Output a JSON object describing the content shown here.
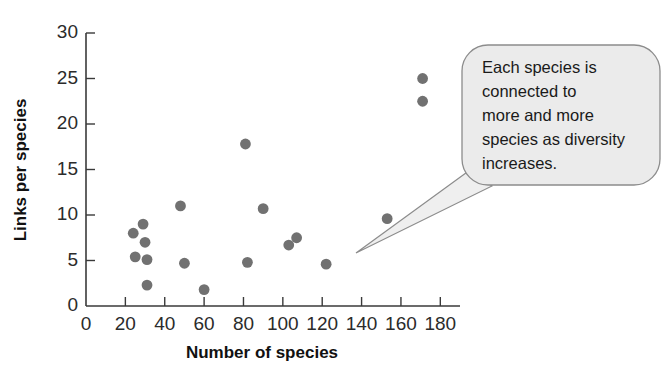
{
  "chart_data": {
    "type": "scatter",
    "title": "",
    "xlabel": "Number of species",
    "ylabel": "Links per species",
    "xlim": [
      0,
      190
    ],
    "ylim": [
      0,
      30
    ],
    "grid": false,
    "legend": null,
    "xticks": [
      0,
      20,
      40,
      60,
      80,
      100,
      120,
      140,
      160,
      180
    ],
    "xtick_labels": [
      "0",
      "20",
      "40",
      "60",
      "80",
      "100",
      "120",
      "140",
      "160",
      "180"
    ],
    "yticks": [
      0,
      5,
      10,
      15,
      20,
      25,
      30
    ],
    "ytick_labels": [
      "0",
      "5",
      "10",
      "15",
      "20",
      "25",
      "30"
    ],
    "point_color": "#717171",
    "points": [
      {
        "x": 24,
        "y": 8.0
      },
      {
        "x": 25,
        "y": 5.4
      },
      {
        "x": 29,
        "y": 9.0
      },
      {
        "x": 30,
        "y": 7.0
      },
      {
        "x": 31,
        "y": 5.1
      },
      {
        "x": 31,
        "y": 2.3
      },
      {
        "x": 48,
        "y": 11.0
      },
      {
        "x": 50,
        "y": 4.7
      },
      {
        "x": 60,
        "y": 1.8
      },
      {
        "x": 81,
        "y": 17.8
      },
      {
        "x": 82,
        "y": 4.8
      },
      {
        "x": 90,
        "y": 10.7
      },
      {
        "x": 103,
        "y": 6.7
      },
      {
        "x": 107,
        "y": 7.5
      },
      {
        "x": 122,
        "y": 4.6
      },
      {
        "x": 153,
        "y": 9.6
      },
      {
        "x": 171,
        "y": 25.0
      },
      {
        "x": 171,
        "y": 22.5
      }
    ],
    "annotations": [
      {
        "id": "diversity-callout",
        "shape": "speech-bubble",
        "lines": [
          "Each species is",
          "connected to",
          "more and more",
          "species as diversity",
          "increases."
        ],
        "fill": "#ebebeb",
        "stroke": "#8c8c8c"
      }
    ]
  }
}
